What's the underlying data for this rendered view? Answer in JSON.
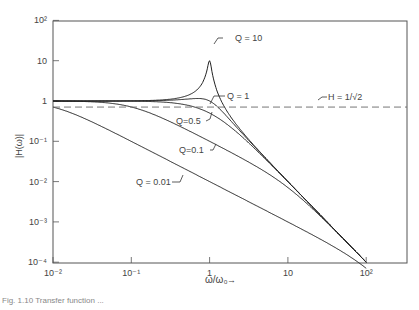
{
  "chart_data": {
    "type": "line",
    "title": "",
    "xlabel": "ω/ω₀",
    "ylabel": "|H(ω)|",
    "xscale": "log",
    "yscale": "log",
    "xlim": [
      0.01,
      500
    ],
    "ylim": [
      0.0001,
      100
    ],
    "x_ticks": [
      0.01,
      0.1,
      1,
      10,
      100
    ],
    "x_tick_labels": [
      "10⁻²",
      "10⁻¹",
      "1",
      "10",
      "10²"
    ],
    "y_ticks": [
      100,
      10,
      1,
      0.1,
      0.01,
      0.001,
      0.0001
    ],
    "y_tick_labels": [
      "10²",
      "10",
      "1",
      "10⁻¹",
      "10⁻²",
      "10⁻³",
      "10⁻⁴"
    ],
    "grid": false,
    "legend": "inline annotations",
    "series": [
      {
        "name": "Q = 10",
        "Q": 10,
        "style": "solid",
        "x": [
          0.01,
          0.1,
          0.5,
          0.9,
          1,
          1.1,
          2,
          10,
          100
        ],
        "values": [
          1.0,
          1.01,
          1.33,
          4.6,
          10,
          4.4,
          0.33,
          0.0101,
          0.0001
        ]
      },
      {
        "name": "Q = 1",
        "Q": 1,
        "style": "solid",
        "x": [
          0.01,
          0.1,
          0.5,
          1,
          2,
          10,
          100
        ],
        "values": [
          1.0,
          1.0,
          1.15,
          1.0,
          0.28,
          0.0101,
          0.0001
        ]
      },
      {
        "name": "Q = 0.5",
        "Q": 0.5,
        "style": "solid",
        "x": [
          0.01,
          0.1,
          0.5,
          1,
          2,
          10,
          100
        ],
        "values": [
          1.0,
          0.99,
          0.8,
          0.5,
          0.2,
          0.0099,
          0.0001
        ]
      },
      {
        "name": "Q = 0.1",
        "Q": 0.1,
        "style": "solid",
        "x": [
          0.01,
          0.1,
          0.5,
          1,
          2,
          10,
          100
        ],
        "values": [
          0.995,
          0.71,
          0.19,
          0.1,
          0.049,
          0.0071,
          0.0001
        ]
      },
      {
        "name": "Q = 0.01",
        "Q": 0.01,
        "style": "solid",
        "x": [
          0.01,
          0.1,
          1,
          10,
          100
        ],
        "values": [
          0.71,
          0.1,
          0.01,
          0.001,
          0.0001
        ]
      },
      {
        "name": "H = 1/√2",
        "style": "dashed",
        "x": [
          0.01,
          500
        ],
        "values": [
          0.707,
          0.707
        ]
      }
    ],
    "annotations": [
      "Q = 10",
      "Q = 1",
      "Q = 0.5",
      "Q = 0.1",
      "Q = 0.01",
      "H = 1/√2"
    ]
  },
  "labels": {
    "q10": "Q = 10",
    "q1": "Q = 1",
    "q05": "Q=0.5",
    "q01": "Q=0.1",
    "q001": "Q = 0.01",
    "h": "H = 1/√2",
    "xlabel": "ω/ω₀",
    "xarrow": "→",
    "ylabel": "|H(ω)|"
  },
  "caption": "Fig. 1.10  Transfer function ..."
}
